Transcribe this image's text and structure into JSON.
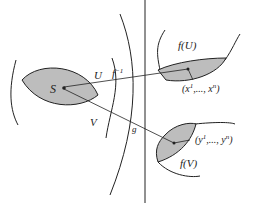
{
  "diagram": {
    "type": "manifold-coordinate-charts",
    "labels": {
      "point": "S",
      "open_set_u": "U",
      "open_set_v": "V",
      "inverse_map": "f",
      "inverse_exp": "−1",
      "map_g": "g",
      "image_u": "f(U)",
      "image_v": "f(V)",
      "coords_x": "(x",
      "coords_x_sup1": "1",
      "coords_x_mid": ",..., x",
      "coords_x_supn": "n",
      "coords_x_end": ")",
      "coords_y": "(y",
      "coords_y_sup1": "1",
      "coords_y_mid": ",..., y",
      "coords_y_supn": "n",
      "coords_y_end": ")"
    },
    "colors": {
      "stroke": "#222222",
      "shade": "#bdbdbd"
    }
  }
}
